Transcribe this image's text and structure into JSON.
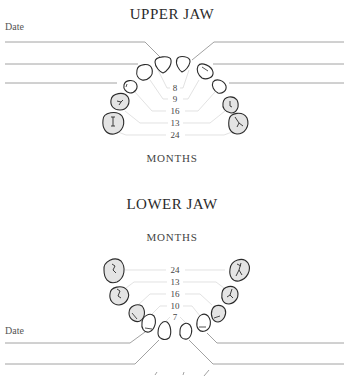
{
  "upper": {
    "title": "UPPER JAW",
    "date_label": "Date",
    "months_label": "MONTHS",
    "eruption_months": [
      "8",
      "9",
      "16",
      "13",
      "24"
    ]
  },
  "lower": {
    "title": "LOWER JAW",
    "date_label": "Date",
    "months_label": "MONTHS",
    "eruption_months": [
      "24",
      "13",
      "16",
      "10",
      "7"
    ]
  },
  "colors": {
    "line": "#8a8a8a",
    "guide": "#d6d6d6",
    "tooth_outline": "#2a2a2a",
    "tooth_fill_molar": "#e4e4e4",
    "tooth_fill_front": "#ffffff"
  }
}
